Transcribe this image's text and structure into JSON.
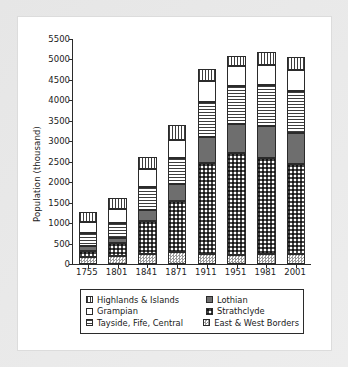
{
  "chart_data": {
    "type": "bar",
    "stacked": true,
    "title": "",
    "xlabel": "",
    "ylabel": "Population (thousand)",
    "categories": [
      "1755",
      "1801",
      "1841",
      "1871",
      "1911",
      "1951",
      "1981",
      "2001"
    ],
    "ylim": [
      0,
      5500
    ],
    "ytick_step": 500,
    "yticks": [
      "5500",
      "5000",
      "4500",
      "4000",
      "3500",
      "3000",
      "2500",
      "2000",
      "1500",
      "1000",
      "500",
      "0"
    ],
    "grid": false,
    "legend_position": "below-axis",
    "stack_order_bottom_to_top": [
      "East & West Borders",
      "Strathclyde",
      "Lothian",
      "Tayside, Fife, Central",
      "Grampian",
      "Highlands & Islands"
    ],
    "series": [
      {
        "name": "East & West Borders",
        "pattern": "small-checkerboard",
        "values": [
          160,
          195,
          255,
          285,
          245,
          230,
          240,
          250
        ]
      },
      {
        "name": "Strathclyde",
        "pattern": "large-checkerboard",
        "values": [
          155,
          310,
          800,
          1260,
          2215,
          2475,
          2350,
          2190
        ]
      },
      {
        "name": "Lothian",
        "pattern": "solid-dark-gray",
        "values": [
          120,
          135,
          270,
          400,
          645,
          720,
          775,
          770
        ]
      },
      {
        "name": "Tayside, Fife, Central",
        "pattern": "horizontal-lines",
        "values": [
          330,
          365,
          555,
          635,
          860,
          930,
          1010,
          1020
        ]
      },
      {
        "name": "Grampian",
        "pattern": "white-empty",
        "values": [
          265,
          330,
          435,
          460,
          505,
          490,
          485,
          520
        ]
      },
      {
        "name": "Highlands & Islands",
        "pattern": "vertical-lines",
        "values": [
          235,
          273,
          305,
          354,
          291,
          251,
          320,
          314
        ]
      }
    ],
    "totals": [
      1265,
      1608,
      2620,
      3394,
      4761,
      5096,
      5180,
      5064
    ]
  },
  "legend": {
    "entries": [
      {
        "label": "Highlands & Islands",
        "swatch": "vertical-lines"
      },
      {
        "label": "Lothian",
        "swatch": "solid-dark-gray"
      },
      {
        "label": "Grampian",
        "swatch": "white-empty"
      },
      {
        "label": "Strathclyde",
        "swatch": "large-checkerboard"
      },
      {
        "label": "Tayside, Fife, Central",
        "swatch": "horizontal-lines"
      },
      {
        "label": "East & West Borders",
        "swatch": "small-checkerboard"
      }
    ]
  },
  "colors": {
    "axis": "#2b2b2b",
    "text": "#1a1a1a",
    "plot_background": "#ffffff",
    "page_background": "#e9e9e9",
    "lothian_fill": "#6e6e6e",
    "hatch_ink": "#3d3d3d"
  }
}
